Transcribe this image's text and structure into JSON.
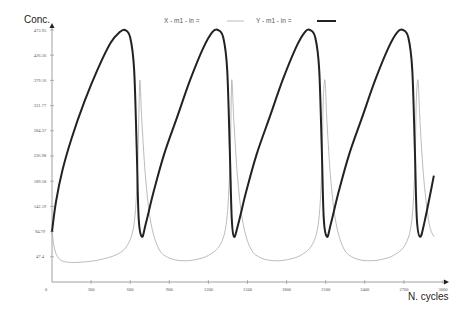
{
  "chart_data": {
    "type": "line",
    "title": "",
    "xlabel": "N. cycles",
    "ylabel": "Conc.",
    "xlim": [
      0,
      3000
    ],
    "ylim": [
      0,
      473.95
    ],
    "grid": false,
    "legend_position": "top",
    "x_ticks": [
      "300",
      "600",
      "900",
      "1200",
      "1500",
      "1800",
      "2100",
      "2400",
      "2700",
      "3000"
    ],
    "y_ticks": [
      "47.4",
      "94.79",
      "142.19",
      "189.58",
      "236.98",
      "284.37",
      "331.77",
      "379.16",
      "426.56",
      "473.95"
    ],
    "origin_label": "0",
    "series": [
      {
        "name": "X - m1 - in =",
        "color": "#aaaaaa",
        "line_width": 0.8,
        "points": [
          [
            0,
            94.79
          ],
          [
            20,
            62
          ],
          [
            50,
            45
          ],
          [
            100,
            38
          ],
          [
            200,
            37
          ],
          [
            350,
            41
          ],
          [
            500,
            52
          ],
          [
            580,
            70
          ],
          [
            630,
            110
          ],
          [
            655,
            200
          ],
          [
            668,
            330
          ],
          [
            675,
            379.16
          ],
          [
            690,
            300
          ],
          [
            720,
            190
          ],
          [
            760,
            110
          ],
          [
            820,
            62
          ],
          [
            900,
            45
          ],
          [
            1000,
            40
          ],
          [
            1100,
            42
          ],
          [
            1200,
            50
          ],
          [
            1290,
            70
          ],
          [
            1340,
            115
          ],
          [
            1365,
            220
          ],
          [
            1375,
            340
          ],
          [
            1381,
            379.16
          ],
          [
            1396,
            300
          ],
          [
            1426,
            190
          ],
          [
            1466,
            110
          ],
          [
            1526,
            62
          ],
          [
            1606,
            45
          ],
          [
            1706,
            40
          ],
          [
            1806,
            42
          ],
          [
            1906,
            50
          ],
          [
            1996,
            70
          ],
          [
            2046,
            115
          ],
          [
            2071,
            220
          ],
          [
            2081,
            340
          ],
          [
            2095,
            379.16
          ],
          [
            2110,
            300
          ],
          [
            2140,
            190
          ],
          [
            2180,
            110
          ],
          [
            2240,
            62
          ],
          [
            2320,
            45
          ],
          [
            2420,
            40
          ],
          [
            2520,
            42
          ],
          [
            2620,
            50
          ],
          [
            2710,
            70
          ],
          [
            2760,
            115
          ],
          [
            2785,
            220
          ],
          [
            2795,
            340
          ],
          [
            2809,
            379.16
          ],
          [
            2824,
            300
          ],
          [
            2854,
            190
          ],
          [
            2894,
            110
          ],
          [
            2930,
            85
          ]
        ]
      },
      {
        "name": "Y - m1 - in =",
        "color": "#222222",
        "line_width": 2,
        "points": [
          [
            0,
            94.79
          ],
          [
            30,
            150
          ],
          [
            80,
            210
          ],
          [
            150,
            270
          ],
          [
            250,
            340
          ],
          [
            350,
            400
          ],
          [
            450,
            450
          ],
          [
            520,
            470
          ],
          [
            560,
            473.95
          ],
          [
            600,
            460
          ],
          [
            630,
            400
          ],
          [
            650,
            250
          ],
          [
            665,
            120
          ],
          [
            690,
            85
          ],
          [
            720,
            110
          ],
          [
            780,
            170
          ],
          [
            860,
            240
          ],
          [
            960,
            310
          ],
          [
            1060,
            380
          ],
          [
            1160,
            440
          ],
          [
            1230,
            470
          ],
          [
            1274,
            473.95
          ],
          [
            1314,
            460
          ],
          [
            1344,
            400
          ],
          [
            1364,
            250
          ],
          [
            1379,
            120
          ],
          [
            1397,
            85
          ],
          [
            1430,
            110
          ],
          [
            1490,
            170
          ],
          [
            1570,
            240
          ],
          [
            1670,
            310
          ],
          [
            1770,
            380
          ],
          [
            1870,
            440
          ],
          [
            1940,
            470
          ],
          [
            1980,
            473.95
          ],
          [
            2020,
            460
          ],
          [
            2050,
            400
          ],
          [
            2070,
            250
          ],
          [
            2085,
            120
          ],
          [
            2110,
            85
          ],
          [
            2140,
            110
          ],
          [
            2200,
            170
          ],
          [
            2280,
            240
          ],
          [
            2380,
            310
          ],
          [
            2480,
            380
          ],
          [
            2580,
            440
          ],
          [
            2650,
            470
          ],
          [
            2694,
            473.95
          ],
          [
            2734,
            460
          ],
          [
            2764,
            400
          ],
          [
            2784,
            250
          ],
          [
            2799,
            120
          ],
          [
            2824,
            85
          ],
          [
            2860,
            115
          ],
          [
            2930,
            200
          ]
        ]
      }
    ]
  },
  "legend": {
    "x_label": "X - m1 - in =",
    "y_label": "Y - m1 - in ="
  }
}
